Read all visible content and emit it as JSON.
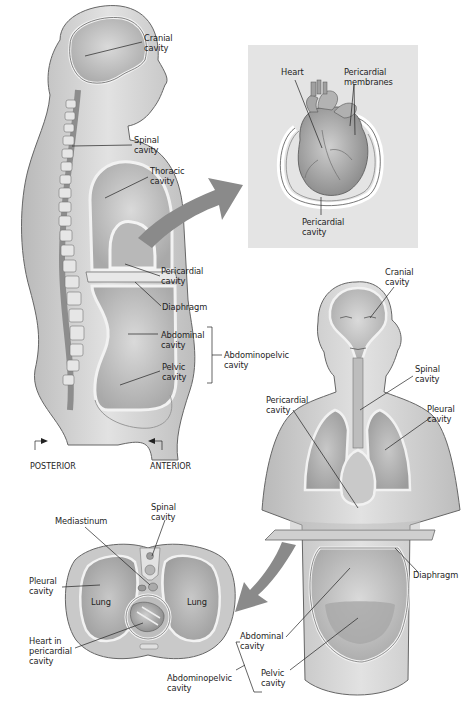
{
  "colors": {
    "background": "#ffffff",
    "heart_panel": "#e4e4e4",
    "arrow": "#8a8a8a",
    "body_fill": "#d6d6d6",
    "cavity_fill": "#c4c4c4",
    "membrane": "#f4f4f4",
    "outline": "#555555",
    "leader": "#222222"
  },
  "lateral_view": {
    "labels": {
      "cranial": "Cranial\ncavity",
      "spinal": "Spinal\ncavity",
      "thoracic": "Thoracic\ncavity",
      "pericardial": "Pericardial\ncavity",
      "diaphragm": "Diaphragm",
      "abdominal": "Abdominal\ncavity",
      "pelvic": "Pelvic\ncavity",
      "abdominopelvic": "Abdominopelvic\ncavity"
    },
    "directions": {
      "posterior": "POSTERIOR",
      "anterior": "ANTERIOR"
    }
  },
  "heart_detail": {
    "labels": {
      "heart": "Heart",
      "membranes": "Pericardial\nmembranes",
      "pericardial": "Pericardial\ncavity"
    }
  },
  "anterior_view": {
    "labels": {
      "cranial": "Cranial\ncavity",
      "spinal": "Spinal\ncavity",
      "pericardial": "Pericardial\ncavity",
      "pleural": "Pleural\ncavity",
      "diaphragm": "Diaphragm",
      "abdominal": "Abdominal\ncavity",
      "pelvic": "Pelvic\ncavity",
      "abdominopelvic": "Abdominopelvic\ncavity"
    }
  },
  "cross_section": {
    "labels": {
      "mediastinum": "Mediastinum",
      "spinal": "Spinal\ncavity",
      "pleural": "Pleural\ncavity",
      "lung_left": "Lung",
      "lung_right": "Lung",
      "heart": "Heart in\npericardial\ncavity"
    }
  }
}
